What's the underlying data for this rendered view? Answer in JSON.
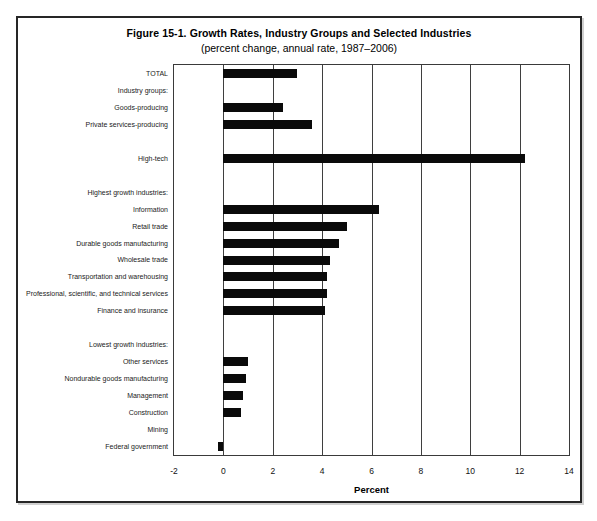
{
  "figure": {
    "title": "Figure 15-1. Growth Rates, Industry Groups and Selected Industries",
    "subtitle": "(percent change, annual rate, 1987–2006)"
  },
  "chart_data": {
    "type": "bar",
    "orientation": "horizontal",
    "title": "Figure 15-1. Growth Rates, Industry Groups and Selected Industries",
    "subtitle": "(percent change, annual rate, 1987–2006)",
    "xlabel": "Percent",
    "xlim": [
      -2,
      14
    ],
    "xticks": [
      -2,
      0,
      2,
      4,
      6,
      8,
      10,
      12,
      14
    ],
    "grid": "vertical",
    "bar_color": "#0a0a0a",
    "rows": [
      {
        "label": "TOTAL",
        "value": 3.0
      },
      {
        "label": "Industry groups:",
        "value": null,
        "header": true
      },
      {
        "label": "Goods-producing",
        "value": 2.4
      },
      {
        "label": "Private services-producing",
        "value": 3.6
      },
      {
        "label": "",
        "value": null,
        "spacer": true
      },
      {
        "label": "High-tech",
        "value": 12.2
      },
      {
        "label": "",
        "value": null,
        "spacer": true
      },
      {
        "label": "Highest growth industries:",
        "value": null,
        "header": true
      },
      {
        "label": "Information",
        "value": 6.3
      },
      {
        "label": "Retail trade",
        "value": 5.0
      },
      {
        "label": "Durable goods manufacturing",
        "value": 4.7
      },
      {
        "label": "Wholesale trade",
        "value": 4.3
      },
      {
        "label": "Transportation and warehousing",
        "value": 4.2
      },
      {
        "label": "Professional, scientific, and technical services",
        "value": 4.2
      },
      {
        "label": "Finance and insurance",
        "value": 4.1
      },
      {
        "label": "",
        "value": null,
        "spacer": true
      },
      {
        "label": "Lowest growth industries:",
        "value": null,
        "header": true
      },
      {
        "label": "Other services",
        "value": 1.0
      },
      {
        "label": "Nondurable goods manufacturing",
        "value": 0.9
      },
      {
        "label": "Management",
        "value": 0.8
      },
      {
        "label": "Construction",
        "value": 0.7
      },
      {
        "label": "Mining",
        "value": 0.0
      },
      {
        "label": "Federal government",
        "value": -0.2
      }
    ]
  }
}
